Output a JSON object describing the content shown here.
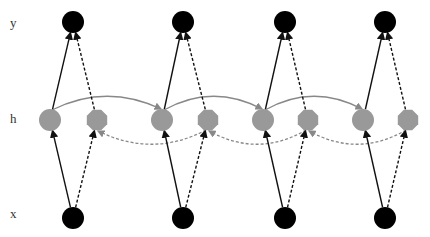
{
  "labels": {
    "y": "y",
    "h": "h",
    "x": "x"
  },
  "colors": {
    "io_node": "#000000",
    "hidden_node": "#999999",
    "edge": "#111111",
    "recurrent_edge": "#888888",
    "background": "#ffffff"
  },
  "timesteps": [
    {
      "x_node": [
        73,
        218
      ],
      "y_node": [
        73,
        22
      ],
      "h_forward": [
        50,
        120
      ],
      "h_backward": [
        97,
        120
      ]
    },
    {
      "x_node": [
        183,
        218
      ],
      "y_node": [
        183,
        22
      ],
      "h_forward": [
        162,
        120
      ],
      "h_backward": [
        208,
        120
      ]
    },
    {
      "x_node": [
        285,
        218
      ],
      "y_node": [
        285,
        22
      ],
      "h_forward": [
        263,
        120
      ],
      "h_backward": [
        308,
        120
      ]
    },
    {
      "x_node": [
        385,
        218
      ],
      "y_node": [
        385,
        22
      ],
      "h_forward": [
        363,
        120
      ],
      "h_backward": [
        408,
        120
      ]
    }
  ],
  "node_radius": 11,
  "forward_arc_top_y": 95,
  "backward_arc_bottom_y": 146
}
